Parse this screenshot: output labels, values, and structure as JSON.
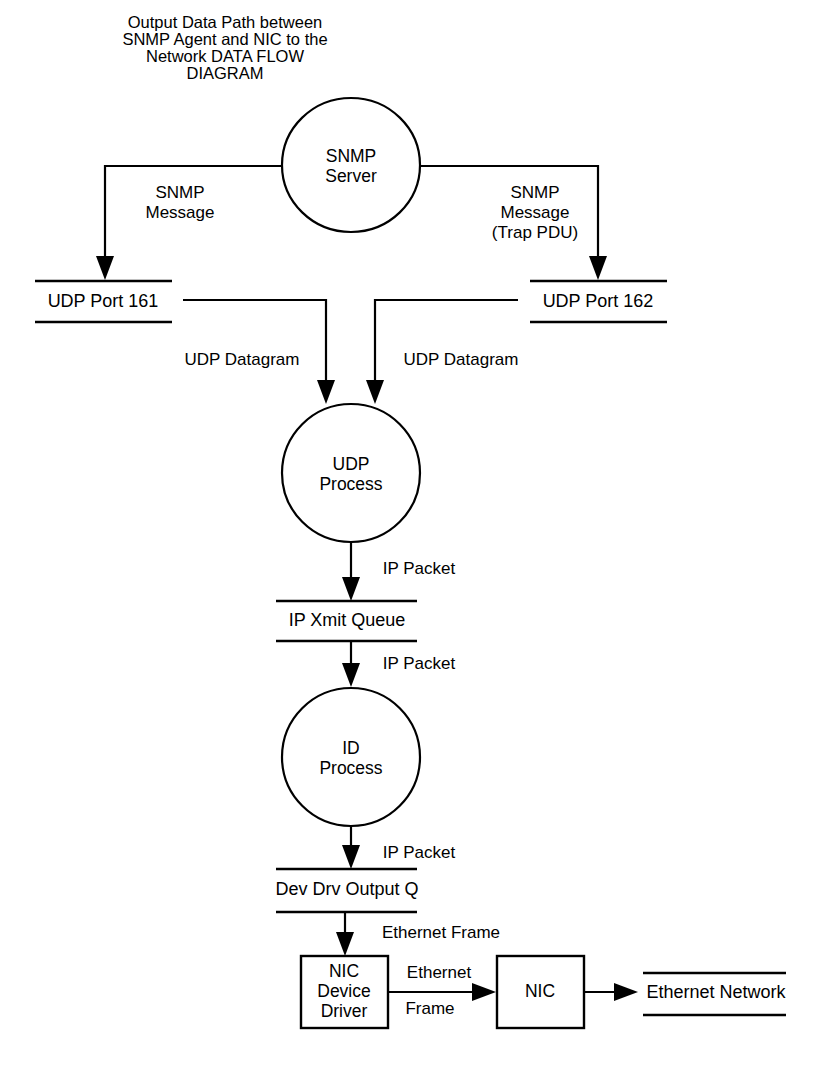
{
  "title": {
    "lines": [
      "Output Data Path between",
      "SNMP Agent and NIC to the",
      "Network DATA FLOW",
      "DIAGRAM"
    ]
  },
  "colors": {
    "stroke": "#000000",
    "background": "#ffffff",
    "text": "#000000"
  },
  "nodes": {
    "snmp_server": {
      "line1": "SNMP",
      "line2": "Server"
    },
    "udp_process": {
      "line1": "UDP",
      "line2": "Process"
    },
    "id_process": {
      "line1": "ID",
      "line2": "Process"
    },
    "nic_device_driver": {
      "line1": "NIC",
      "line2": "Device",
      "line3": "Driver"
    },
    "nic": {
      "line1": "NIC"
    }
  },
  "stores": {
    "udp_port_161": "UDP Port 161",
    "udp_port_162": "UDP Port 162",
    "ip_xmit_queue": "IP Xmit Queue",
    "dev_drv_output_q": "Dev Drv Output Q",
    "ethernet_network": "Ethernet Network"
  },
  "flows": {
    "snmp_message_left": {
      "line1": "SNMP",
      "line2": "Message"
    },
    "snmp_message_right": {
      "line1": "SNMP",
      "line2": "Message",
      "line3": "(Trap PDU)"
    },
    "udp_datagram_left": "UDP Datagram",
    "udp_datagram_right": "UDP Datagram",
    "ip_packet_1": "IP Packet",
    "ip_packet_2": "IP Packet",
    "ip_packet_3": "IP Packet",
    "ethernet_frame_top": "Ethernet Frame",
    "ethernet_frame_mid": {
      "line1": "Ethernet",
      "line2": "Frame"
    }
  }
}
